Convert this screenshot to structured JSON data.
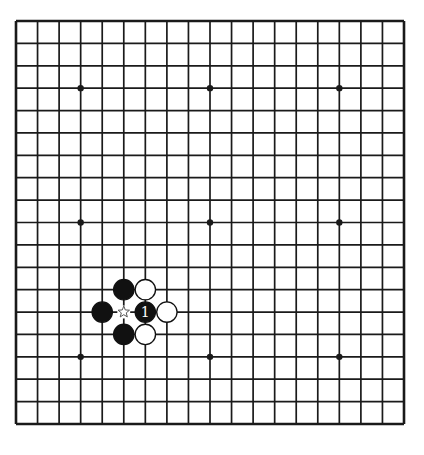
{
  "board": {
    "size": 19,
    "left": 16,
    "top": 21,
    "right": 404,
    "bottom": 424,
    "line_color": "#1a1a1a",
    "background": "#ffffff",
    "star_points": [
      [
        3,
        3
      ],
      [
        9,
        3
      ],
      [
        15,
        3
      ],
      [
        3,
        9
      ],
      [
        9,
        9
      ],
      [
        15,
        9
      ],
      [
        3,
        15
      ],
      [
        9,
        15
      ],
      [
        15,
        15
      ]
    ]
  },
  "stones": [
    {
      "col": 5,
      "row": 12,
      "color": "black"
    },
    {
      "col": 6,
      "row": 12,
      "color": "white"
    },
    {
      "col": 4,
      "row": 13,
      "color": "black"
    },
    {
      "col": 6,
      "row": 13,
      "color": "black",
      "label": "1"
    },
    {
      "col": 7,
      "row": 13,
      "color": "white"
    },
    {
      "col": 5,
      "row": 14,
      "color": "black"
    },
    {
      "col": 6,
      "row": 14,
      "color": "white"
    }
  ],
  "markers": [
    {
      "col": 5,
      "row": 13,
      "type": "star-marker"
    }
  ],
  "caption": ""
}
